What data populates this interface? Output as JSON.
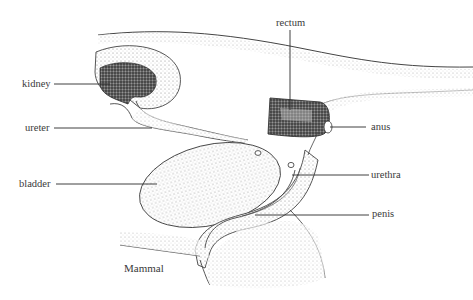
{
  "diagram": {
    "caption": "Mammal",
    "labels": {
      "kidney": "kidney",
      "ureter": "ureter",
      "bladder": "bladder",
      "rectum": "rectum",
      "anus": "anus",
      "urethra": "urethra",
      "penis": "penis"
    },
    "colors": {
      "ink": "#333333",
      "stipple": "#9a9a9a",
      "dark_stipple": "#2e2e2e",
      "background": "#ffffff"
    }
  }
}
